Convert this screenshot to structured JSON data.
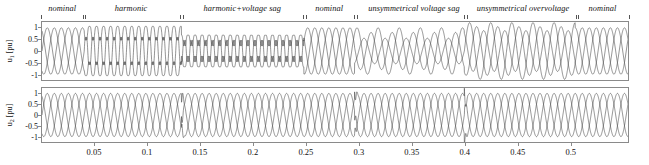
{
  "figure": {
    "title": "",
    "width": 649,
    "height": 165,
    "background": "#ffffff",
    "axis_color": "#8a8a8a",
    "trace_color": "#3a3a3a"
  },
  "regions": [
    {
      "label": "nominal",
      "center_t": 0.02,
      "start_t": 0.0,
      "end_t": 0.04
    },
    {
      "label": "harmonic",
      "center_t": 0.085,
      "start_t": 0.04,
      "end_t": 0.132
    },
    {
      "label": "harmonic+voltage sag",
      "center_t": 0.19,
      "start_t": 0.132,
      "end_t": 0.248
    },
    {
      "label": "nominal",
      "center_t": 0.272,
      "start_t": 0.248,
      "end_t": 0.296
    },
    {
      "label": "unsymmetrical voltage sag",
      "center_t": 0.352,
      "start_t": 0.296,
      "end_t": 0.4
    },
    {
      "label": "unsymmetrical overvoltage",
      "center_t": 0.455,
      "start_t": 0.4,
      "end_t": 0.505
    },
    {
      "label": "nominal",
      "center_t": 0.53,
      "start_t": 0.505,
      "end_t": 0.555
    }
  ],
  "region_boundaries_t": [
    0.0,
    0.04,
    0.132,
    0.248,
    0.296,
    0.4,
    0.505,
    0.555
  ],
  "subplots": [
    {
      "id": "top",
      "ylabel_main": "u",
      "ylabel_sub": "1",
      "ylabel_unit": "[pu]",
      "ylabel_full": "u1 [pu]",
      "yticks": [
        1,
        0.5,
        0,
        -0.5,
        -1
      ],
      "ytick_labels": [
        "1",
        "0.5",
        "0",
        "-0.5",
        "-1"
      ],
      "ylim": [
        -1.25,
        1.25
      ]
    },
    {
      "id": "bottom",
      "ylabel_main": "u",
      "ylabel_sub": "2",
      "ylabel_unit": "[pu]",
      "ylabel_full": "u2 [pu]",
      "yticks": [
        1,
        0.5,
        0,
        -0.5,
        -1
      ],
      "ytick_labels": [
        "1",
        "0.5",
        "0",
        "-0.5",
        "-1"
      ],
      "ylim": [
        -1.25,
        1.25
      ]
    }
  ],
  "xaxis": {
    "label": "",
    "ticks": [
      0.05,
      0.1,
      0.15,
      0.2,
      0.25,
      0.3,
      0.35,
      0.4,
      0.45,
      0.5
    ],
    "tick_labels": [
      "0.05",
      "0.1",
      "0.15",
      "0.2",
      "0.25",
      "0.3",
      "0.35",
      "0.4",
      "0.45",
      "0.5"
    ],
    "xlim": [
      0.0,
      0.555
    ]
  },
  "chart_data": {
    "type": "line",
    "title": "",
    "xlabel": "",
    "ylabel": "u [pu]",
    "xlim": [
      0.0,
      0.555
    ],
    "ylim": [
      -1.25,
      1.25
    ],
    "grid": false,
    "legend": "none",
    "fundamental_frequency_hz": 50,
    "phases": [
      "a",
      "b",
      "c"
    ],
    "phase_offsets_deg": [
      0,
      -120,
      -240
    ],
    "series": [
      {
        "name": "u1 (grid / distorted voltage)",
        "subplot": "top",
        "description": "Three-phase voltage with sequential power-quality disturbances",
        "segments": [
          {
            "label": "nominal",
            "t_range": [
              0.0,
              0.04
            ],
            "amplitude_pu": [
              1.0,
              1.0,
              1.0
            ],
            "harmonics": [],
            "phase_shift_deg": [
              0,
              -120,
              -240
            ]
          },
          {
            "label": "harmonic",
            "t_range": [
              0.04,
              0.132
            ],
            "amplitude_pu": [
              1.0,
              1.0,
              1.0
            ],
            "harmonics": [
              {
                "order": 5,
                "mag_pu": 0.18
              },
              {
                "order": 7,
                "mag_pu": 0.12
              }
            ],
            "phase_shift_deg": [
              0,
              -120,
              -240
            ]
          },
          {
            "label": "harmonic+voltage sag",
            "t_range": [
              0.132,
              0.248
            ],
            "amplitude_pu": [
              0.62,
              0.62,
              0.62
            ],
            "harmonics": [
              {
                "order": 5,
                "mag_pu": 0.18
              },
              {
                "order": 7,
                "mag_pu": 0.12
              }
            ],
            "phase_shift_deg": [
              0,
              -120,
              -240
            ]
          },
          {
            "label": "nominal",
            "t_range": [
              0.248,
              0.296
            ],
            "amplitude_pu": [
              1.0,
              1.0,
              1.0
            ],
            "harmonics": [],
            "phase_shift_deg": [
              0,
              -120,
              -240
            ]
          },
          {
            "label": "unsymmetrical voltage sag",
            "t_range": [
              0.296,
              0.4
            ],
            "amplitude_pu": [
              0.55,
              0.8,
              1.0
            ],
            "harmonics": [],
            "phase_shift_deg": [
              0,
              -120,
              -240
            ]
          },
          {
            "label": "unsymmetrical overvoltage",
            "t_range": [
              0.4,
              0.505
            ],
            "amplitude_pu": [
              1.22,
              1.05,
              0.88
            ],
            "harmonics": [],
            "phase_shift_deg": [
              0,
              -120,
              -240
            ]
          },
          {
            "label": "nominal",
            "t_range": [
              0.505,
              0.555
            ],
            "amplitude_pu": [
              1.0,
              1.0,
              1.0
            ],
            "harmonics": [],
            "phase_shift_deg": [
              0,
              -120,
              -240
            ]
          }
        ]
      },
      {
        "name": "u2 (compensated / load voltage)",
        "subplot": "bottom",
        "description": "Three-phase voltage held at nominal amplitude by compensation; brief transients at disturbance onsets",
        "segments": [
          {
            "label": "nominal",
            "t_range": [
              0.0,
              0.04
            ],
            "amplitude_pu": [
              1.0,
              1.0,
              1.0
            ],
            "harmonics": [],
            "phase_shift_deg": [
              0,
              -120,
              -240
            ]
          },
          {
            "label": "harmonic",
            "t_range": [
              0.04,
              0.132
            ],
            "amplitude_pu": [
              1.0,
              1.0,
              1.0
            ],
            "harmonics": [],
            "phase_shift_deg": [
              0,
              -120,
              -240
            ]
          },
          {
            "label": "harmonic+voltage sag",
            "t_range": [
              0.132,
              0.248
            ],
            "amplitude_pu": [
              1.0,
              1.0,
              1.0
            ],
            "harmonics": [],
            "phase_shift_deg": [
              0,
              -120,
              -240
            ]
          },
          {
            "label": "nominal",
            "t_range": [
              0.248,
              0.296
            ],
            "amplitude_pu": [
              1.0,
              1.0,
              1.0
            ],
            "harmonics": [],
            "phase_shift_deg": [
              0,
              -120,
              -240
            ]
          },
          {
            "label": "unsymmetrical voltage sag",
            "t_range": [
              0.296,
              0.4
            ],
            "amplitude_pu": [
              1.0,
              1.0,
              1.0
            ],
            "harmonics": [],
            "phase_shift_deg": [
              0,
              -120,
              -240
            ]
          },
          {
            "label": "unsymmetrical overvoltage",
            "t_range": [
              0.4,
              0.505
            ],
            "amplitude_pu": [
              1.0,
              1.0,
              1.0
            ],
            "harmonics": [],
            "phase_shift_deg": [
              0,
              -120,
              -240
            ]
          },
          {
            "label": "nominal",
            "t_range": [
              0.505,
              0.555
            ],
            "amplitude_pu": [
              1.0,
              1.0,
              1.0
            ],
            "harmonics": [],
            "phase_shift_deg": [
              0,
              -120,
              -240
            ]
          }
        ],
        "transients_t": [
          0.132,
          0.296,
          0.4
        ]
      }
    ]
  }
}
